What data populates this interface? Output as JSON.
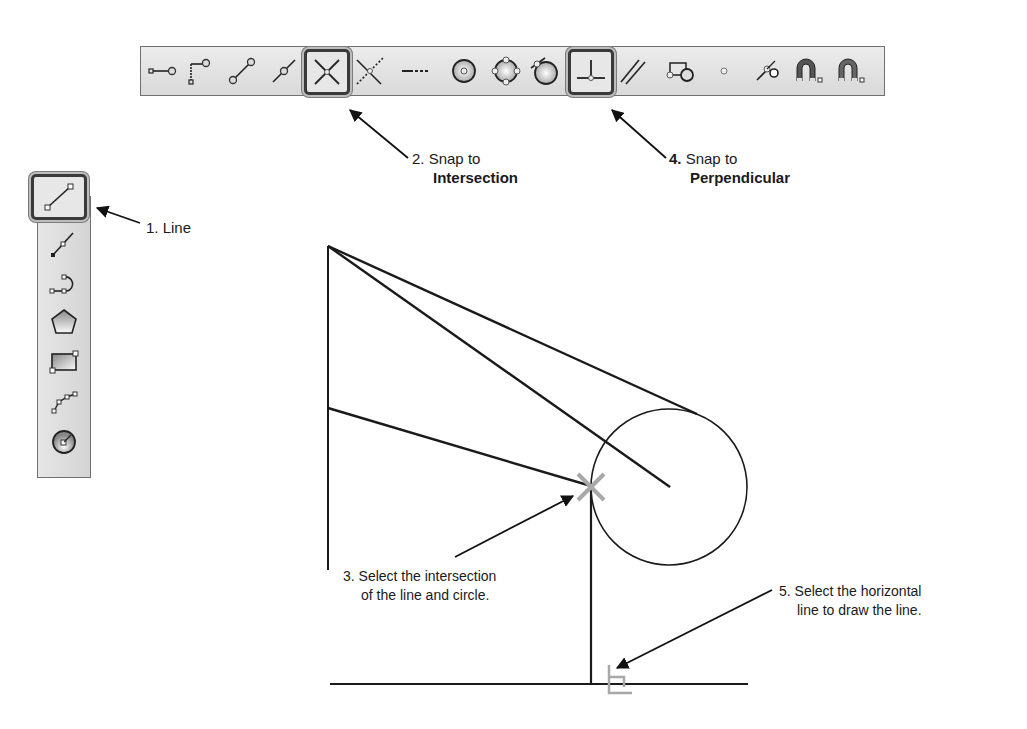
{
  "toolbar_top": {
    "tools": [
      {
        "name": "snap-endpoint-icon",
        "label": "Endpoint"
      },
      {
        "name": "snap-endpoint-corner-icon",
        "label": "Endpoint corner"
      },
      {
        "name": "snap-midline-icon",
        "label": "Line"
      },
      {
        "name": "snap-midpoint-icon",
        "label": "Midpoint"
      },
      {
        "name": "snap-intersection-icon",
        "label": "Intersection",
        "active": true
      },
      {
        "name": "snap-apparent-intersection-icon",
        "label": "Apparent intersection"
      },
      {
        "name": "snap-extension-icon",
        "label": "Extension"
      },
      {
        "name": "snap-center-icon",
        "label": "Center"
      },
      {
        "name": "snap-quadrant-icon",
        "label": "Quadrant"
      },
      {
        "name": "snap-tangent-icon",
        "label": "Tangent"
      },
      {
        "name": "snap-perpendicular-icon",
        "label": "Perpendicular",
        "active": true
      },
      {
        "name": "snap-parallel-icon",
        "label": "Parallel"
      },
      {
        "name": "snap-insert-icon",
        "label": "Insert"
      },
      {
        "name": "snap-node-icon",
        "label": "Node"
      },
      {
        "name": "snap-nearest-icon",
        "label": "Nearest"
      },
      {
        "name": "snap-off-magnet-icon",
        "label": "None"
      },
      {
        "name": "snap-settings-magnet-icon",
        "label": "Snap settings"
      }
    ]
  },
  "toolbar_left": {
    "tools": [
      {
        "name": "draw-line-icon",
        "label": "Line",
        "active": true
      },
      {
        "name": "draw-polyline-icon",
        "label": "Polyline"
      },
      {
        "name": "draw-arc-polyline-icon",
        "label": "Arc polyline"
      },
      {
        "name": "draw-polygon-icon",
        "label": "Polygon"
      },
      {
        "name": "draw-rectangle-icon",
        "label": "Rectangle"
      },
      {
        "name": "draw-spline-icon",
        "label": "Spline"
      },
      {
        "name": "draw-circle-icon",
        "label": "Circle"
      }
    ]
  },
  "callouts": {
    "step1": {
      "text": "1. Line"
    },
    "step2": {
      "prefix": "2. Snap to",
      "emphasis": "Intersection"
    },
    "step3": {
      "line1": "3. Select the intersection",
      "line2": "of the line and circle."
    },
    "step4": {
      "number": "4.",
      "prefix": " Snap to",
      "emphasis": "Perpendicular"
    },
    "step5": {
      "line1": "5. Select the horizontal",
      "line2": "line to draw the line."
    }
  },
  "colors": {
    "line": "#1a1a1a",
    "snap_marker": "#a8a8a8",
    "toolbar_bg": "#dedede"
  }
}
